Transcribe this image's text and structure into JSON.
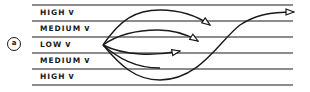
{
  "diagram": {
    "marker": "a",
    "rows": [
      {
        "label": "HIGH",
        "glyph": "ᴠ"
      },
      {
        "label": "MEDIUM",
        "glyph": "ᴠ"
      },
      {
        "label": "LOW",
        "glyph": "ᴠ"
      },
      {
        "label": "MEDIUM",
        "glyph": "ᴠ"
      },
      {
        "label": "HIGH",
        "glyph": "ᴠ"
      }
    ],
    "colors": {
      "ink": "#1a1a1a",
      "background": "#ffffff"
    }
  }
}
